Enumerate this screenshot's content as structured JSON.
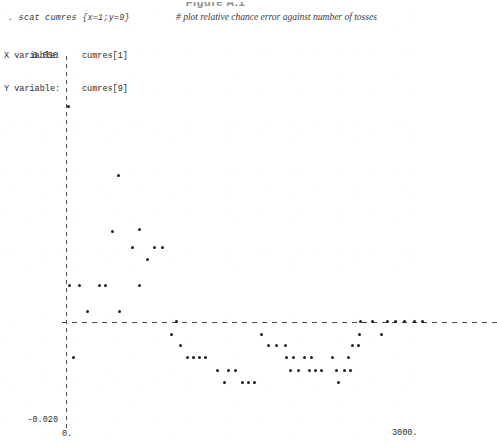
{
  "figure": {
    "caption": "Figure A.1"
  },
  "command": {
    "prompt": ". scat cumres {x=1;y=9}",
    "comment": "# plot relative chance error against number of tosses"
  },
  "variables": [
    {
      "label": "X variable:",
      "name": "cumres[1]"
    },
    {
      "label": "Y variable:",
      "name": "cumres[9]"
    }
  ],
  "axes": {
    "y_top_label": "0.050",
    "y_bottom_label": "-0.020",
    "x_left_label": "0.",
    "x_right_label": "3000."
  },
  "chart_data": {
    "type": "scatter",
    "title": "Figure A.1",
    "subtitle": "# plot relative chance error against number of tosses",
    "xlabel": "cumres[1]",
    "ylabel": "cumres[9]",
    "xlim": [
      0,
      3000
    ],
    "ylim": [
      -0.02,
      0.05
    ],
    "grid": false,
    "legend": "none",
    "zero_line": 0.0,
    "marker": "dot",
    "series": [
      {
        "name": "cumres[9] vs cumres[1]",
        "points": [
          [
            20,
            0.0405
          ],
          [
            440,
            0.0275
          ],
          [
            390,
            0.017
          ],
          [
            620,
            0.0173
          ],
          [
            560,
            0.014
          ],
          [
            740,
            0.014
          ],
          [
            810,
            0.014
          ],
          [
            680,
            0.0117
          ],
          [
            30,
            0.0068
          ],
          [
            110,
            0.0068
          ],
          [
            280,
            0.0068
          ],
          [
            330,
            0.0068
          ],
          [
            620,
            0.0068
          ],
          [
            180,
            0.002
          ],
          [
            450,
            0.002
          ],
          [
            930,
            0.0
          ],
          [
            2470,
            0.0
          ],
          [
            2570,
            0.0
          ],
          [
            2690,
            0.0
          ],
          [
            2760,
            0.0
          ],
          [
            2840,
            0.0
          ],
          [
            2920,
            0.0
          ],
          [
            2990,
            0.0
          ],
          [
            880,
            -0.0024
          ],
          [
            1640,
            -0.0024
          ],
          [
            2460,
            -0.0024
          ],
          [
            2640,
            -0.0024
          ],
          [
            960,
            -0.0045
          ],
          [
            1700,
            -0.0045
          ],
          [
            1760,
            -0.0045
          ],
          [
            1840,
            -0.0045
          ],
          [
            2400,
            -0.0045
          ],
          [
            2450,
            -0.0045
          ],
          [
            60,
            -0.0068
          ],
          [
            1020,
            -0.0068
          ],
          [
            1070,
            -0.0068
          ],
          [
            1120,
            -0.0068
          ],
          [
            1170,
            -0.0068
          ],
          [
            1850,
            -0.0068
          ],
          [
            1910,
            -0.0068
          ],
          [
            2000,
            -0.0068
          ],
          [
            2060,
            -0.0068
          ],
          [
            2230,
            -0.0068
          ],
          [
            2370,
            -0.0068
          ],
          [
            1270,
            -0.0092
          ],
          [
            1360,
            -0.0092
          ],
          [
            1420,
            -0.0092
          ],
          [
            1880,
            -0.0092
          ],
          [
            1950,
            -0.0092
          ],
          [
            2040,
            -0.0092
          ],
          [
            2090,
            -0.0092
          ],
          [
            2140,
            -0.0092
          ],
          [
            2270,
            -0.0092
          ],
          [
            2330,
            -0.0092
          ],
          [
            2380,
            -0.0092
          ],
          [
            1330,
            -0.0115
          ],
          [
            1480,
            -0.0115
          ],
          [
            1530,
            -0.0115
          ],
          [
            1580,
            -0.0115
          ],
          [
            2280,
            -0.0115
          ]
        ]
      }
    ]
  }
}
